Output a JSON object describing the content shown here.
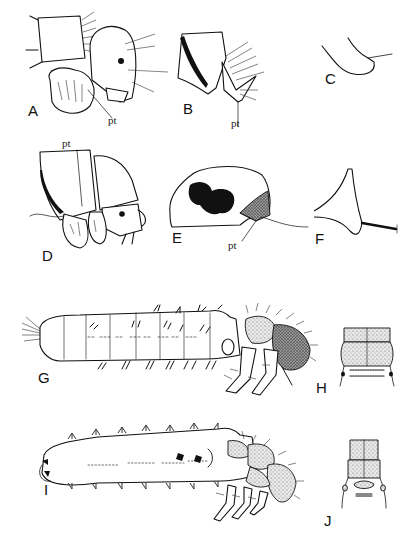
{
  "figure": {
    "panels": [
      {
        "id": "A",
        "label": "A",
        "subject": "larval head, lateral view",
        "annotation": "pt"
      },
      {
        "id": "B",
        "label": "B",
        "subject": "sclerite with setae",
        "annotation": "pt"
      },
      {
        "id": "C",
        "label": "C",
        "subject": "hooked sclerite outline"
      },
      {
        "id": "D",
        "label": "D",
        "subject": "larval head and thorax, lateral view",
        "annotation": "pt"
      },
      {
        "id": "E",
        "label": "E",
        "subject": "sclerite with dark patch",
        "annotation": "pt"
      },
      {
        "id": "F",
        "label": "F",
        "subject": "triangular sclerite with seta"
      },
      {
        "id": "G",
        "label": "G",
        "subject": "whole larva, lateral view"
      },
      {
        "id": "H",
        "label": "H",
        "subject": "thoracic nota, dorsal view"
      },
      {
        "id": "I",
        "label": "I",
        "subject": "whole larva, lateral view"
      },
      {
        "id": "J",
        "label": "J",
        "subject": "thoracic nota, dorsal view"
      }
    ]
  }
}
